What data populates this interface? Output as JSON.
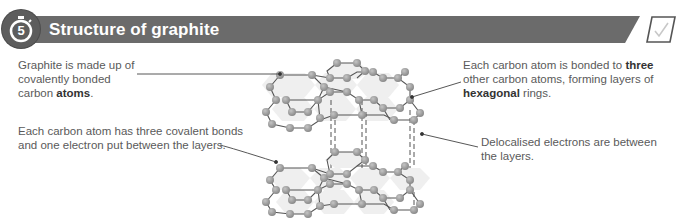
{
  "header": {
    "step_number": "5",
    "title": "Structure of graphite",
    "bar_color": "#6b6b6b",
    "icons": {
      "step": "stopwatch-icon",
      "done": "checkmark-icon"
    }
  },
  "annotations": {
    "graphite": {
      "parts": [
        "Graphite is made up of covalently bonded carbon ",
        "atoms",
        "."
      ]
    },
    "covalent": {
      "text": "Each carbon atom has three covalent bonds and one electron put between the layers."
    },
    "bonded": {
      "parts": [
        "Each carbon atom is bonded to ",
        "three",
        " other carbon atoms, forming layers of ",
        "hexagonal",
        " rings."
      ]
    },
    "delocalised": {
      "text": "Delocalised electrons are between the layers."
    }
  },
  "diagram": {
    "layers": 2,
    "atom_color": "#9a9a9a",
    "bond_color": "#555555",
    "layer_fill": "#eeeeee"
  }
}
